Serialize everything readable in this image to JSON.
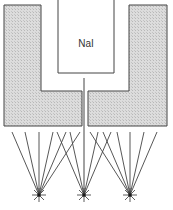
{
  "diagram": {
    "title": "",
    "detector_label": "NaI",
    "components": [
      "NaI crystal",
      "collimator shield (left)",
      "collimator shield (right)",
      "collimator hole",
      "point sources"
    ],
    "sources": [
      {
        "name": "source-left",
        "x": 39,
        "y": 195
      },
      {
        "name": "source-center",
        "x": 84,
        "y": 195
      },
      {
        "name": "source-right",
        "x": 130,
        "y": 195
      }
    ],
    "colors": {
      "shield_fill": "#d4d4d4",
      "line": "#444444"
    }
  }
}
